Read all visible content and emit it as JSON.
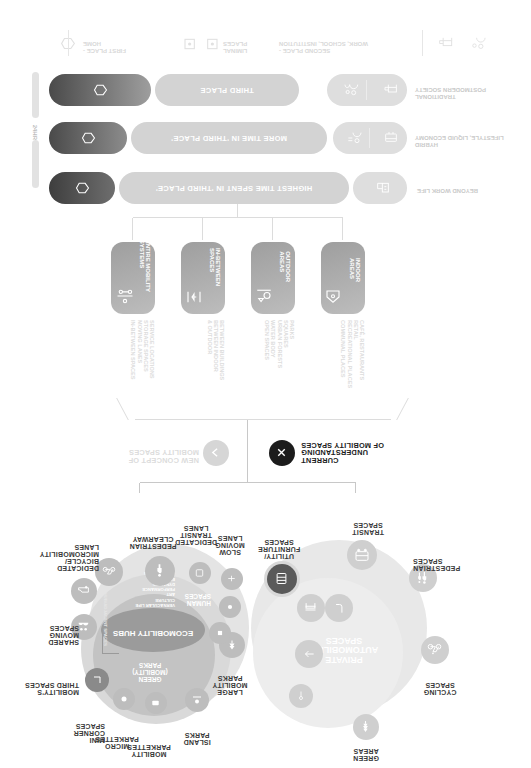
{
  "diagram": {
    "title_current": "CURRENT UNDERSTANDING\nOF MOBILITY SPACES",
    "title_new": "NEW CONCEPT OF\nMOBILITY SPACES",
    "icon_current": "x-circle-icon",
    "icon_new": "chevron-right-circle-icon"
  },
  "cluster_current": {
    "core_label": "PRIVATE\nAUTOMOBILITY\nSPACES",
    "nodes": [
      {
        "label": "GREEN\nAREAS",
        "icon": "tree-icon"
      },
      {
        "label": "CYCLING\nSPACES",
        "icon": "bicycle-icon"
      },
      {
        "label": "PEDESTRIAN\nSPACES",
        "icon": "pedestrian-icon"
      },
      {
        "label": "TRANSIT\nSPACES",
        "icon": "bus-icon"
      },
      {
        "label": "UTILITY/\nFURNITURE\nSPACES",
        "icon": "bench-icon"
      }
    ]
  },
  "cluster_new": {
    "core_label": "ECOMOBILITY HUBS",
    "secondary_label": "GREEN\n(MOBILITY)\nPARKS",
    "human_label": "HUMAN\nSPACES",
    "human_detail": "VERNACULAR LIFE\nCULTURE\nART\nPERFORMANCE\nDYNAMICS\nEDUCATION\nCONNECTIONS",
    "adjacent_label": "HUB/ADJACENT SPACES",
    "nodes": [
      {
        "label": "LARGE\nMOBILITY\nPARKS",
        "icon": "park-icon"
      },
      {
        "label": "ISLAND\nPARKS",
        "icon": "island-icon"
      },
      {
        "label": "MOBILITY\nPARKETTES",
        "icon": "parkette-icon"
      },
      {
        "label": "MICRO\nPARKETTES",
        "icon": "micro-parkette-icon"
      },
      {
        "label": "MINI\nCORNER\nSPACES",
        "icon": "corner-icon"
      },
      {
        "label": "MOBILITY'S\nTHIRD SPACES",
        "icon": "third-space-icon"
      },
      {
        "label": "SHARED\nMOVING\nSPACES",
        "icon": "shared-moving-icon"
      },
      {
        "label": "DEDICATED\nBICYCLE/\nMICROMOBILITY\nLANES",
        "icon": "bicycle-icon"
      },
      {
        "label": "PEDESTRIAN\nCLEARWAY",
        "icon": "pedestrian-icon"
      },
      {
        "label": "DEDICATED\nTRANSIT\nLANES",
        "icon": "transit-icon"
      },
      {
        "label": "SLOW\nMOVING\nLANES",
        "icon": "slow-lane-icon"
      }
    ]
  },
  "categories": [
    {
      "label": "INDOOR\nAREAS",
      "icon": "indoor-icon",
      "items": "CAFÉ, RESTAURANTS\nRETAIL\nRECREATIONAL PLACES\nCOMMUNAL PLACES"
    },
    {
      "label": "OUTDOOR\nAREAS",
      "icon": "outdoor-icon",
      "items": "PARKS\nSQUARES\nURBAN FORESTS\nWATER BODY\nOPEN SPACES"
    },
    {
      "label": "IN-BETWEEN\nSPACES",
      "icon": "in-between-icon",
      "items": "BETWEEN BUILDINGS\nBETWEEN INDOOR\n& OUTDOOR"
    },
    {
      "label": "ENTIRE MOBILITY\nSYSTEMS",
      "icon": "mobility-system-icon",
      "items": "SERVICE LOCATIONS\nSTORAGE SPACES\nMOVING LANES\nIN-BETWEEN SPACES"
    }
  ],
  "timeline": {
    "scale_label": "24HR",
    "rows": [
      {
        "era": "BEYOND WORK LIFE",
        "bar_label": "HIGHEST TIME SPENT IN 'THIRD PLACE'",
        "icons": [
          "work-life-icon"
        ]
      },
      {
        "era": "HYBRID\nLIFESTYLE, LIQUID ECONOMY",
        "bar_label": "MORE TIME IN 'THIRD PLACE'",
        "icons": [
          "hybrid-work-icon",
          "hybrid-home-icon"
        ]
      },
      {
        "era": "TRADITIONAL\nPOSTMODERN SOCIETY",
        "bar_label": "THIRD PLACE",
        "icons": [
          "office-icon",
          "desk-icon"
        ]
      }
    ],
    "legend": [
      {
        "label": "FIRST PLACE -\nHOME",
        "icon": "home-pentagon-icon"
      },
      {
        "label": "LIMINAL\nPLACES",
        "icon": "liminal-icon"
      },
      {
        "label": "SECOND PLACE -\nWORK, SCHOOL, INSTITUTION",
        "icon": "work-icon"
      }
    ]
  },
  "colors": {
    "dark": "#3a3a3a",
    "mid": "#9e9e9e",
    "light": "#d3d3d3",
    "pale": "#e8e8e8"
  }
}
